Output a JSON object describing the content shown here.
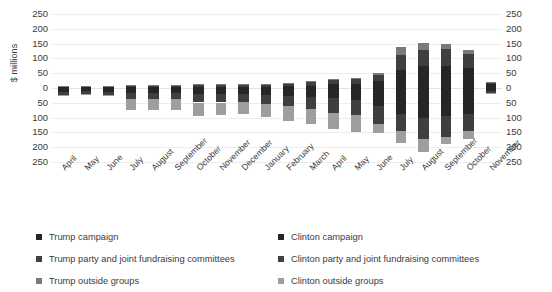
{
  "chart_data": {
    "type": "bar",
    "title": "",
    "subtitle": "",
    "xlabel": "",
    "ylabel": "$ millions",
    "stacked": true,
    "orientation": "diverging-vertical",
    "grid": true,
    "legend_position": "bottom",
    "ylim": [
      -250,
      250
    ],
    "yticks": [
      250,
      200,
      150,
      100,
      50,
      0,
      50,
      100,
      150,
      200,
      250
    ],
    "ytick_labels": [
      "250",
      "200",
      "150",
      "100",
      "50",
      "0",
      "50",
      "100",
      "150",
      "200",
      "250"
    ],
    "y_axis_note": "Trump totals plotted upward (positive), Clinton totals plotted downward (negative); both axes labelled with absolute magnitudes.",
    "categories": [
      "April",
      "May",
      "June",
      "July",
      "August",
      "September",
      "October",
      "November",
      "December",
      "January",
      "February",
      "March",
      "April",
      "May",
      "June",
      "July",
      "August",
      "September",
      "October",
      "November"
    ],
    "series": [
      {
        "name": "Trump campaign",
        "side": "up",
        "color": "#262626",
        "values": [
          2,
          2,
          2,
          3,
          3,
          3,
          4,
          4,
          4,
          5,
          6,
          8,
          12,
          13,
          25,
          62,
          75,
          74,
          68,
          12
        ]
      },
      {
        "name": "Trump party and joint fundraising committees",
        "side": "up",
        "color": "#3f3f3f",
        "values": [
          5,
          5,
          5,
          7,
          7,
          7,
          8,
          8,
          8,
          9,
          10,
          12,
          16,
          17,
          20,
          48,
          55,
          58,
          48,
          6
        ]
      },
      {
        "name": "Trump outside groups",
        "side": "up",
        "color": "#7a7a7a",
        "values": [
          1,
          1,
          1,
          1,
          1,
          1,
          1,
          1,
          1,
          1,
          1,
          2,
          3,
          3,
          5,
          30,
          22,
          18,
          12,
          2
        ]
      },
      {
        "name": "Clinton campaign",
        "side": "down",
        "color": "#262626",
        "values": [
          12,
          11,
          12,
          16,
          16,
          16,
          21,
          21,
          20,
          23,
          26,
          30,
          35,
          40,
          62,
          88,
          100,
          96,
          88,
          10
        ]
      },
      {
        "name": "Clinton party and joint fundraising committees",
        "side": "down",
        "color": "#3f3f3f",
        "values": [
          10,
          9,
          11,
          20,
          22,
          21,
          28,
          28,
          27,
          30,
          34,
          40,
          48,
          52,
          60,
          58,
          72,
          68,
          58,
          8
        ]
      },
      {
        "name": "Clinton outside groups",
        "side": "down",
        "color": "#9e9e9e",
        "values": [
          2,
          2,
          2,
          38,
          38,
          36,
          44,
          42,
          42,
          46,
          50,
          52,
          56,
          58,
          30,
          40,
          45,
          26,
          28,
          3
        ]
      }
    ]
  },
  "legend": {
    "columns": [
      {
        "items": [
          {
            "label": "Trump campaign",
            "color": "#262626",
            "swatch": "legend-swatch-square"
          },
          {
            "label": "Trump party and joint fundraising committees",
            "color": "#3f3f3f",
            "swatch": "legend-swatch-square"
          },
          {
            "label": "Trump outside groups",
            "color": "#7a7a7a",
            "swatch": "legend-swatch-square"
          }
        ]
      },
      {
        "items": [
          {
            "label": "Clinton campaign",
            "color": "#262626",
            "swatch": "legend-swatch-square"
          },
          {
            "label": "Clinton party and joint fundraising committees",
            "color": "#3f3f3f",
            "swatch": "legend-swatch-square"
          },
          {
            "label": "Clinton outside groups",
            "color": "#9e9e9e",
            "swatch": "legend-swatch-square"
          }
        ]
      }
    ]
  },
  "colors": {
    "gridline": "#ededed",
    "zero_line": "#e2e2e2",
    "text": "#3b3b3b",
    "background": "#ffffff"
  }
}
